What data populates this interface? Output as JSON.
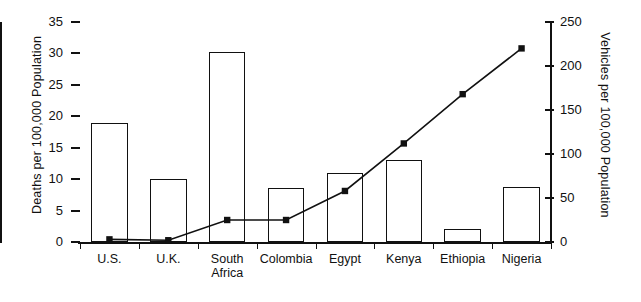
{
  "chart_data": {
    "type": "bar",
    "title": "",
    "categories": [
      "U.S.",
      "U.K.",
      "South\nAfrica",
      "Colombia",
      "Egypt",
      "Kenya",
      "Ethiopia",
      "Nigeria"
    ],
    "series": [
      {
        "name": "Deaths per 100,000 Population",
        "type": "bar",
        "axis": "left",
        "values": [
          19,
          10,
          30.2,
          8.6,
          11,
          13,
          2,
          8.7
        ]
      },
      {
        "name": "Vehicles per 100,000 Population",
        "type": "line",
        "axis": "right",
        "marker": "square",
        "values": [
          3,
          2,
          25,
          25,
          58,
          112,
          168,
          220
        ]
      }
    ],
    "xlabel": "",
    "ylabel": "Deaths per 100,000 Population",
    "ylabel_right": "Vehicles per 100,000 Population",
    "ylim": [
      0,
      35
    ],
    "ylim_right": [
      0,
      250
    ],
    "yticks": [
      "0",
      "5",
      "10",
      "15",
      "20",
      "25",
      "30",
      "35"
    ],
    "yticks_right": [
      "0",
      "50",
      "100",
      "150",
      "200",
      "250"
    ],
    "grid": false,
    "legend": "none",
    "colors": {
      "axis": "#111111",
      "bar_fill": "#ffffff",
      "bar_stroke": "#111111",
      "line": "#111111",
      "marker": "#111111"
    }
  }
}
